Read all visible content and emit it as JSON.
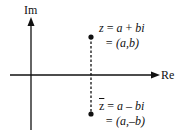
{
  "diagram": {
    "type": "complex-plane",
    "axes": {
      "vertical_label": "Im",
      "horizontal_label": "Re"
    },
    "points": [
      {
        "name": "z",
        "line1": {
          "lhs": "z",
          "eq": " = ",
          "a": "a",
          "op": " + ",
          "b": "bi"
        },
        "line2": "= (a,b)"
      },
      {
        "name": "z-conjugate",
        "line1": {
          "lhs": "z",
          "eq": " = ",
          "a": "a",
          "op": " – ",
          "b": "bi"
        },
        "line2": "= (a,–b)"
      }
    ],
    "colors": {
      "ink": "#111111",
      "background": "#ffffff"
    }
  }
}
